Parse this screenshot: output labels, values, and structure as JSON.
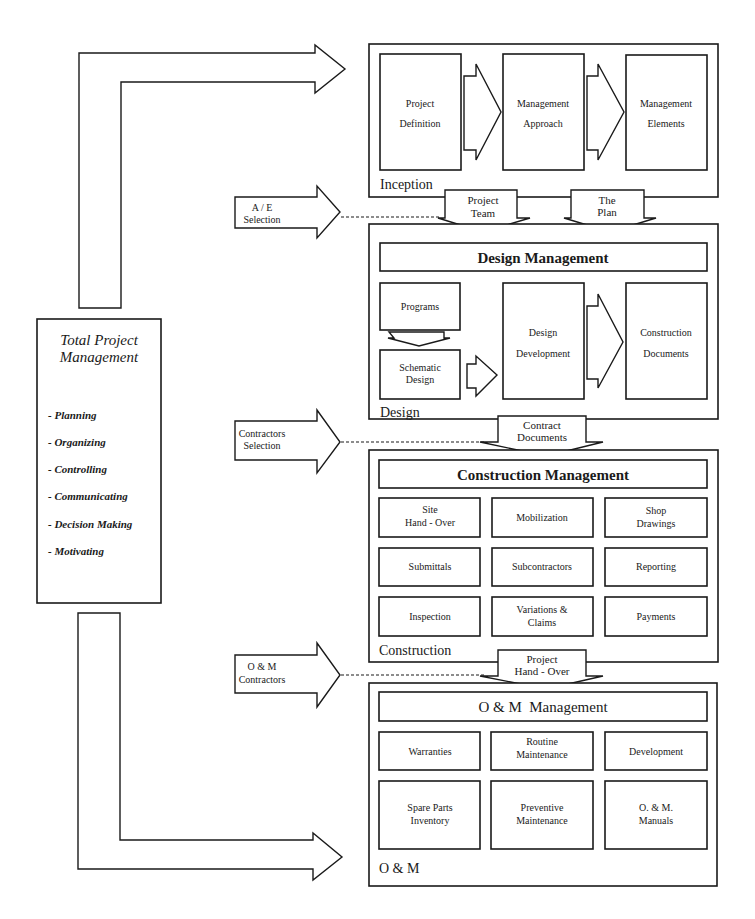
{
  "total_pm": {
    "title_line1": "Total Project",
    "title_line2": "Management",
    "functions": [
      "- Planning",
      "- Organizing",
      "- Controlling",
      "- Communicating",
      "- Decision Making",
      "- Motivating"
    ]
  },
  "inception": {
    "label": "Inception",
    "steps": [
      {
        "line1": "Project",
        "line2": "Definition"
      },
      {
        "line1": "Management",
        "line2": "Approach"
      },
      {
        "line1": "Management",
        "line2": "Elements"
      }
    ]
  },
  "transfer_1": [
    {
      "line1": "Project",
      "line2": "Team"
    },
    {
      "line1": "The",
      "line2": "Plan"
    }
  ],
  "design": {
    "label": "Design",
    "header": "Design Management",
    "programs": "Programs",
    "schematic": {
      "line1": "Schematic",
      "line2": "Design"
    },
    "development": {
      "line1": "Design",
      "line2": "Development"
    },
    "documents": {
      "line1": "Construction",
      "line2": "Documents"
    }
  },
  "transfer_2": {
    "line1": "Contract",
    "line2": "Documents"
  },
  "construction": {
    "label": "Construction",
    "header": "Construction Management",
    "items": [
      {
        "line1": "Site",
        "line2": "Hand - Over"
      },
      {
        "line1": "Mobilization",
        "line2": ""
      },
      {
        "line1": "Shop",
        "line2": "Drawings"
      },
      {
        "line1": "Submittals",
        "line2": ""
      },
      {
        "line1": "Subcontractors",
        "line2": ""
      },
      {
        "line1": "Reporting",
        "line2": ""
      },
      {
        "line1": "Inspection",
        "line2": ""
      },
      {
        "line1": "Variations &",
        "line2": "Claims"
      },
      {
        "line1": "Payments",
        "line2": ""
      }
    ]
  },
  "transfer_3": {
    "line1": "Project",
    "line2": "Hand - Over"
  },
  "om": {
    "label": "O & M",
    "header": "O & M  Management",
    "items": [
      {
        "line1": "Warranties",
        "line2": ""
      },
      {
        "line1": "Routine",
        "line2": "Maintenance"
      },
      {
        "line1": "Development",
        "line2": ""
      },
      {
        "line1": "Spare Parts",
        "line2": "Inventory"
      },
      {
        "line1": "Preventive",
        "line2": "Maintenance"
      },
      {
        "line1": "O. & M.",
        "line2": "Manuals"
      }
    ]
  },
  "inputs": [
    {
      "line1": "A / E",
      "line2": "Selection"
    },
    {
      "line1": "Contractors",
      "line2": "Selection"
    },
    {
      "line1": "O & M",
      "line2": "Contractors"
    }
  ],
  "colors": {
    "ink": "#1a1a1a",
    "background": "#ffffff"
  }
}
